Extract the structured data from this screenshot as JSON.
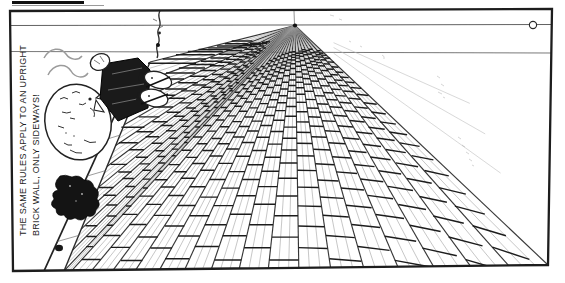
{
  "caption": {
    "line1": "THE SAME RULES APPLY TO AN UPRIGHT",
    "line2": "BRICK WALL, ONLY SIDEWAYS!"
  },
  "perspective": {
    "vp": [
      295,
      25.5
    ],
    "horizon_y": 25,
    "upper_guide_y": 52.5,
    "marker_point": [
      533,
      25
    ],
    "border": [
      [
        10,
        11
      ],
      [
        552,
        9
      ],
      [
        548,
        265
      ],
      [
        13,
        271
      ]
    ],
    "band_inner": [
      [
        150,
        62
      ],
      [
        64,
        271
      ]
    ],
    "band_outer": [
      [
        140,
        60
      ],
      [
        44,
        271
      ]
    ],
    "band_courses": 10,
    "bottom_x0": 72,
    "course_w0": 20,
    "course_grow": 1.3,
    "bottom_courses": 16,
    "thin_per_course": 3,
    "row_base": 246.5,
    "row_ratio": 0.9,
    "row_count": 26,
    "min_brick_w": 3.2,
    "sparse_right": [
      [
        552,
        210
      ],
      [
        552,
        172
      ],
      [
        552,
        140
      ]
    ],
    "colors": {
      "ink": "#1d1d1d",
      "course_line": "#3a3a3a",
      "thin_line": "#9b9b9b",
      "joint": "#1c1c1c",
      "guide": "#5a5a5a",
      "faint": "#8d8d8d",
      "paper": "#ffffff"
    }
  }
}
